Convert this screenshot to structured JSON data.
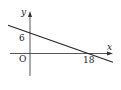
{
  "diagram": {
    "type": "linear-function-graph",
    "axes": {
      "x_label": "x",
      "y_label": "y",
      "origin_label": "O"
    },
    "line": {
      "y_intercept_label": "6",
      "x_intercept_label": "18",
      "y_intercept": 6,
      "x_intercept": 18
    },
    "colors": {
      "line": "#222222",
      "axis": "#333333",
      "text": "#222222"
    }
  }
}
